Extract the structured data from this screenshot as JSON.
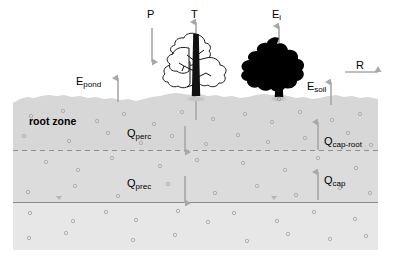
{
  "diagram": {
    "colors": {
      "root_zone_fill": "#d9d9d9",
      "subsoil_fill": "#dcdcdc",
      "saturated_fill": "#e6e6e6",
      "arrow": "#a8a8a8",
      "line": "#8c8c8c",
      "tree_silhouette": "#000000",
      "speck": "#b0b0b0",
      "text": "#000000",
      "background": "#ffffff"
    },
    "layers": [
      {
        "name": "root zone",
        "label": "root zone",
        "top": 95,
        "bottom": 150
      },
      {
        "name": "subsoil",
        "label": "",
        "top": 150,
        "bottom": 202
      },
      {
        "name": "saturated zone",
        "label": "",
        "top": 202,
        "bottom": 250
      }
    ],
    "boundaries": [
      {
        "name": "ground-surface",
        "style": "irregular",
        "y": 97
      },
      {
        "name": "root-zone-base",
        "style": "dashed",
        "y": 150
      },
      {
        "name": "water-table",
        "style": "solid",
        "y": 202
      }
    ]
  },
  "flux_labels": {
    "precipitation": {
      "symbol": "P",
      "sub": "",
      "direction": "down"
    },
    "transpiration": {
      "symbol": "T",
      "sub": "",
      "direction": "up"
    },
    "interception_evap": {
      "symbol": "E",
      "sub": "i",
      "direction": "up"
    },
    "pond_evap": {
      "symbol": "E",
      "sub": "pond",
      "direction": "up"
    },
    "soil_evap": {
      "symbol": "E",
      "sub": "soil",
      "direction": "up"
    },
    "runoff": {
      "symbol": "R",
      "sub": "",
      "direction": "right"
    },
    "percolation": {
      "symbol": "Q",
      "sub": "perc",
      "direction": "down"
    },
    "deep_percolation": {
      "symbol": "Q",
      "sub": "prec",
      "direction": "down"
    },
    "capillary_rise_root": {
      "symbol": "Q",
      "sub": "cap-root",
      "direction": "up"
    },
    "capillary_rise": {
      "symbol": "Q",
      "sub": "cap",
      "direction": "up"
    }
  },
  "zone_labels": {
    "root_zone": "root zone"
  },
  "trees": [
    {
      "name": "outline-tree",
      "style": "outline",
      "x": 196,
      "label_flux": "T"
    },
    {
      "name": "silhouette-tree",
      "style": "filled",
      "x": 279,
      "label_flux": "Ei"
    }
  ]
}
